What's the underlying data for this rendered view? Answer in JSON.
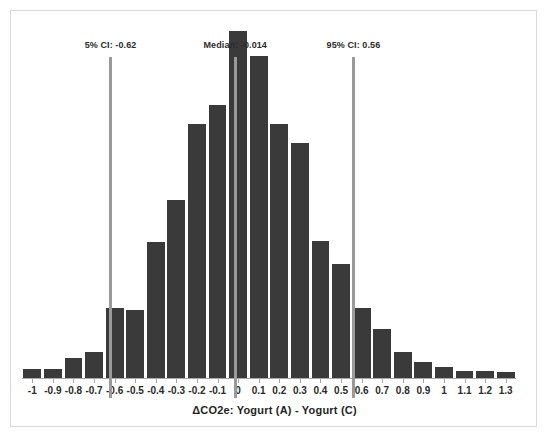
{
  "chart_data": {
    "type": "bar",
    "title": "",
    "subtitle": "",
    "xlabel": "ΔCO2e: Yogurt (A) - Yogurt (C)",
    "ylabel": "",
    "grid": false,
    "legend": "none",
    "xlim": [
      -1.05,
      1.35
    ],
    "ylim": [
      0,
      290
    ],
    "bar_color": "#3a3a3a",
    "marker_color": "#9a9a9a",
    "frame_color": "#d9d9d9",
    "tick_labels": [
      "-1",
      "-0.9",
      "-0.8",
      "-0.7",
      "-0.6",
      "-0.5",
      "-0.4",
      "-0.3",
      "-0.2",
      "-0.1",
      "0",
      "0.1",
      "0.2",
      "0.3",
      "0.4",
      "0.5",
      "0.6",
      "0.7",
      "0.8",
      "0.9",
      "1",
      "1.1",
      "1.2",
      "1.3"
    ],
    "bin_centers": [
      -1.05,
      -0.95,
      -0.85,
      -0.75,
      -0.65,
      -0.55,
      -0.45,
      -0.35,
      -0.25,
      -0.15,
      -0.05,
      0.05,
      0.15,
      0.25,
      0.35,
      0.45,
      0.55,
      0.65,
      0.75,
      0.85,
      0.95,
      1.05,
      1.15,
      1.25
    ],
    "categories": [
      "-1.05",
      "-0.95",
      "-0.85",
      "-0.75",
      "-0.65",
      "-0.55",
      "-0.45",
      "-0.35",
      "-0.25",
      "-0.15",
      "-0.05",
      "0.05",
      "0.15",
      "0.25",
      "0.35",
      "0.45",
      "0.55",
      "0.65",
      "0.75",
      "0.85",
      "0.95",
      "1.05",
      "1.15",
      "1.25"
    ],
    "values": [
      7,
      7,
      16,
      21,
      57,
      55,
      110,
      144,
      206,
      221,
      281,
      261,
      206,
      190,
      111,
      92,
      57,
      40,
      21,
      13,
      9,
      6,
      6,
      5
    ],
    "annotations": [
      {
        "name": "lower-ci",
        "label": "5% CI: -0.62",
        "value": -0.62
      },
      {
        "name": "median",
        "label": "Median: -0.014",
        "value": -0.014
      },
      {
        "name": "upper-ci",
        "label": "95% CI: 0.56",
        "value": 0.56
      }
    ]
  }
}
